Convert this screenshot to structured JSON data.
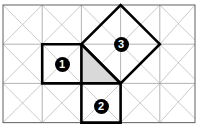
{
  "figure": {
    "canvas": {
      "width": 198,
      "height": 128
    },
    "colors": {
      "background": "#ffffff",
      "grid_line": "#a8a8a8",
      "diagonal_line": "#b4b4b4",
      "border": "#6e6e6e",
      "bold_shape": "#000000",
      "triangle_fill": "#d9d9d9",
      "badge_fill": "#000000",
      "badge_text": "#ffffff"
    },
    "grid": {
      "columns": 5,
      "rows": 3,
      "cell_width": 39.2,
      "cell_height": 39.2,
      "origin_x": 3,
      "origin_y": 5,
      "x_lines": [
        3,
        42.2,
        81.4,
        120.6,
        159.8,
        195
      ],
      "y_lines": [
        5,
        44.2,
        83.4,
        122.6
      ],
      "diagonals": "both",
      "border_visible": true
    },
    "shapes": [
      {
        "id": "square-1",
        "label": "1",
        "kind": "square",
        "points": "42.2,44.2 81.4,44.2 81.4,83.4 42.2,83.4",
        "fill": "none",
        "stroke": "#000000",
        "stroke_width": 2.6,
        "badge": {
          "x": 62,
          "y": 64
        }
      },
      {
        "id": "square-2",
        "label": "2",
        "kind": "square",
        "points": "81.4,83.4 120.6,83.4 120.6,122.6 81.4,122.6",
        "fill": "none",
        "stroke": "#000000",
        "stroke_width": 2.6,
        "badge": {
          "x": 101,
          "y": 106
        }
      },
      {
        "id": "square-3",
        "label": "3",
        "kind": "rotated-square",
        "points": "81.4,44.2 120.6,5 159.8,44.2 120.6,83.4",
        "fill": "none",
        "stroke": "#000000",
        "stroke_width": 2.6,
        "badge": {
          "x": 121,
          "y": 44
        }
      },
      {
        "id": "right-triangle",
        "label": "",
        "kind": "triangle",
        "points": "81.4,44.2 120.6,83.4 81.4,83.4",
        "fill": "#d9d9d9",
        "stroke": "#000000",
        "stroke_width": 2.6,
        "badge": null
      }
    ],
    "badges": [
      {
        "name": "badge-1",
        "label": "1",
        "x": 62,
        "y": 64
      },
      {
        "name": "badge-2",
        "label": "2",
        "x": 101,
        "y": 106
      },
      {
        "name": "badge-3",
        "label": "3",
        "x": 121,
        "y": 44
      }
    ]
  }
}
